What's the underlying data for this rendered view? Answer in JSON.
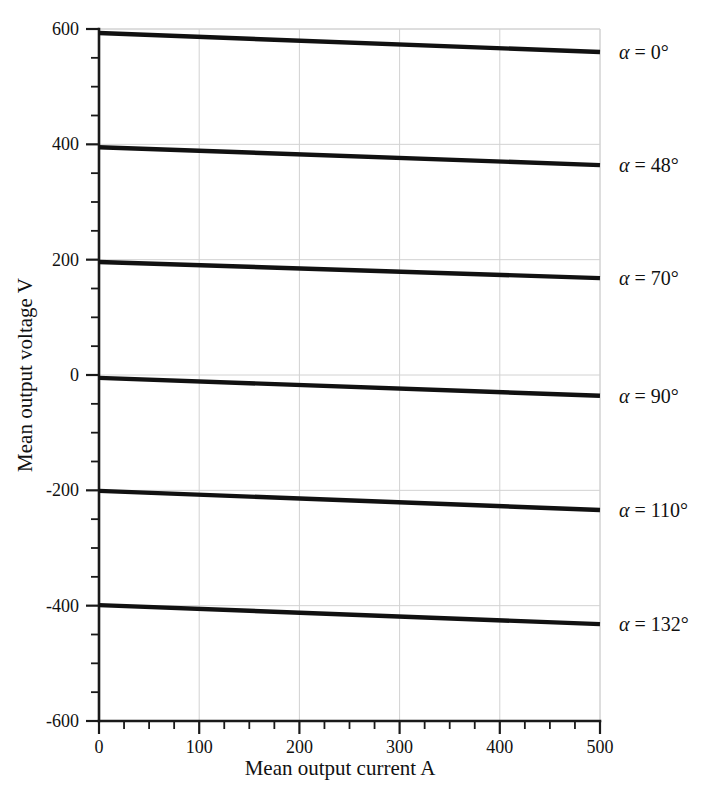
{
  "chart_data": {
    "type": "line",
    "title": "",
    "xlabel": "Mean output current A",
    "ylabel": "Mean output voltage V",
    "xlim": [
      0,
      500
    ],
    "ylim": [
      -600,
      600
    ],
    "xticks": [
      0,
      100,
      200,
      300,
      400,
      500
    ],
    "yticks": [
      -600,
      -400,
      -200,
      0,
      200,
      400,
      600
    ],
    "xtick_labels": [
      "0",
      "100",
      "200",
      "300",
      "400",
      "500"
    ],
    "ytick_labels": [
      "-600",
      "-400",
      "-200",
      "0",
      "200",
      "400",
      "600"
    ],
    "x_minor_step": 25,
    "y_minor_step": 50,
    "grid": true,
    "grid_color": "#d2d2d2",
    "line_color": "#111111",
    "legend_position": "right-inline",
    "x": [
      0,
      500
    ],
    "series": [
      {
        "name": "alpha-0",
        "label_prefix": "α",
        "label_value": "= 0°",
        "label_text": "α = 0°",
        "values": [
          593,
          560
        ]
      },
      {
        "name": "alpha-48",
        "label_prefix": "α",
        "label_value": "= 48°",
        "label_text": "α = 48°",
        "values": [
          395,
          364
        ]
      },
      {
        "name": "alpha-70",
        "label_prefix": "α",
        "label_value": "= 70°",
        "label_text": "α = 70°",
        "values": [
          196,
          168
        ]
      },
      {
        "name": "alpha-90",
        "label_prefix": "α",
        "label_value": "= 90°",
        "label_text": "α = 90°",
        "values": [
          -5,
          -36
        ]
      },
      {
        "name": "alpha-110",
        "label_prefix": "α",
        "label_value": "= 110°",
        "label_text": "α = 110°",
        "values": [
          -201,
          -234
        ]
      },
      {
        "name": "alpha-132",
        "label_prefix": "α",
        "label_value": "= 132°",
        "label_text": "α = 132°",
        "values": [
          -399,
          -432
        ]
      }
    ]
  }
}
